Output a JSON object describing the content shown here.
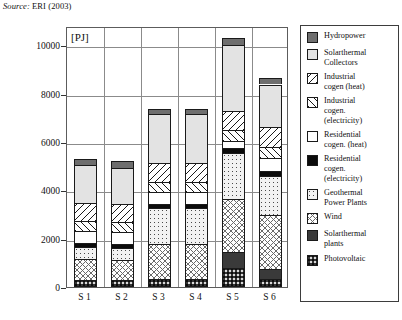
{
  "source": {
    "prefix": "Source:",
    "text": " ERI (2003)"
  },
  "chart_data": {
    "type": "bar",
    "subtype": "stacked-bar",
    "title": "",
    "unit_label": "[PJ]",
    "xlabel": "",
    "ylabel": "[PJ]",
    "ylim": [
      0,
      10800
    ],
    "yticks": [
      0,
      2000,
      4000,
      6000,
      8000,
      10000
    ],
    "ytick_labels": [
      "0",
      "2000",
      "4000",
      "6000",
      "8000",
      "10000"
    ],
    "grid": true,
    "legend_position": "right",
    "categories": [
      "S 1",
      "S 2",
      "S 3",
      "S 4",
      "S 5",
      "S 6"
    ],
    "series": [
      {
        "name": "Photovoltaic",
        "key": "pv",
        "values": [
          300,
          300,
          330,
          330,
          800,
          350
        ]
      },
      {
        "name": "Solarthermal plants",
        "key": "solplant",
        "values": [
          0,
          0,
          0,
          0,
          650,
          400
        ]
      },
      {
        "name": "Wind",
        "key": "wind",
        "values": [
          850,
          820,
          1430,
          1430,
          2200,
          2250
        ]
      },
      {
        "name": "Geothermal Power Plants",
        "key": "geo",
        "values": [
          500,
          480,
          1500,
          1500,
          1900,
          1600
        ]
      },
      {
        "name": "Residential cogen. (electricity)",
        "key": "reselec",
        "values": [
          180,
          180,
          190,
          190,
          200,
          220
        ]
      },
      {
        "name": "Residential cogen. (heat)",
        "key": "resheat",
        "values": [
          480,
          480,
          480,
          480,
          300,
          500
        ]
      },
      {
        "name": "Industrial cogen. (electricity)",
        "key": "indelec",
        "values": [
          420,
          420,
          430,
          430,
          450,
          480
        ]
      },
      {
        "name": "Industrial cogen (heat)",
        "key": "indheat",
        "values": [
          760,
          760,
          780,
          780,
          800,
          830
        ]
      },
      {
        "name": "Solarthermal Collectors",
        "key": "solcoll",
        "values": [
          1560,
          1500,
          2020,
          2020,
          2700,
          1750
        ]
      },
      {
        "name": "Hydropower",
        "key": "hydro",
        "values": [
          250,
          260,
          190,
          190,
          300,
          270
        ]
      }
    ],
    "totals": [
      5300,
      5200,
      7350,
      7350,
      10300,
      8650
    ]
  },
  "legend": {
    "items": [
      {
        "label": "Hydropower",
        "key": "hydro"
      },
      {
        "label": "Solarthermal\nCollectors",
        "key": "solcoll"
      },
      {
        "label": "Industrial\ncogen (heat)",
        "key": "indheat"
      },
      {
        "label": "Industrial\ncogen.\n(electricity)",
        "key": "indelec"
      },
      {
        "label": "Residential\ncogen. (heat)",
        "key": "resheat"
      },
      {
        "label": "Residential\ncogen.\n(electricity)",
        "key": "reselec"
      },
      {
        "label": "Geothermal\nPower Plants",
        "key": "geo"
      },
      {
        "label": "Wind",
        "key": "wind"
      },
      {
        "label": "Solarthermal\nplants",
        "key": "solplant"
      },
      {
        "label": "Photovoltaic",
        "key": "pv"
      }
    ]
  }
}
